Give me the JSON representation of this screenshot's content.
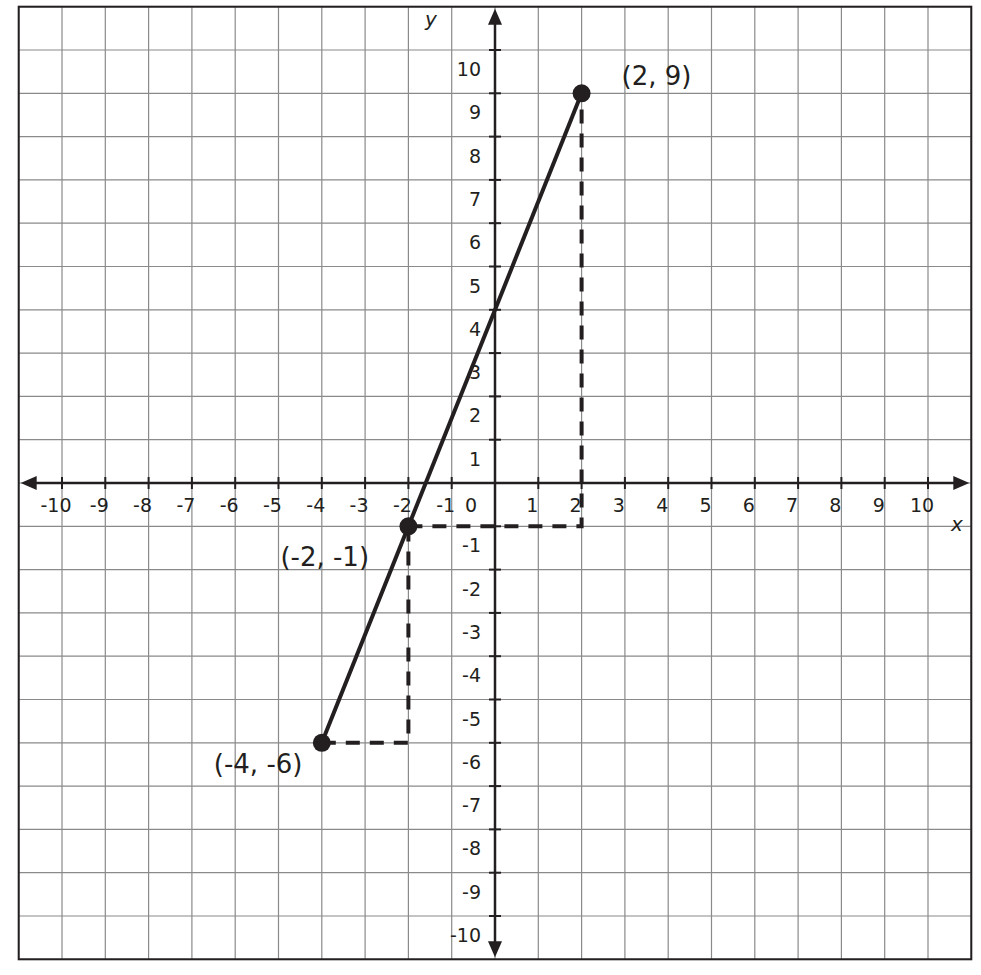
{
  "chart_data": {
    "type": "line",
    "title": "",
    "xlabel": "x",
    "ylabel": "y",
    "xlim": [
      -11,
      11
    ],
    "ylim": [
      -11,
      11
    ],
    "grid": true,
    "x_ticks": [
      -10,
      -9,
      -8,
      -7,
      -6,
      -5,
      -4,
      -3,
      -2,
      -1,
      0,
      1,
      2,
      3,
      4,
      5,
      6,
      7,
      8,
      9,
      10
    ],
    "y_ticks": [
      -10,
      -9,
      -8,
      -7,
      -6,
      -5,
      -4,
      -3,
      -2,
      -1,
      1,
      2,
      3,
      4,
      5,
      6,
      7,
      8,
      9,
      10
    ],
    "series": [
      {
        "name": "line",
        "style": "solid",
        "points": [
          {
            "x": -4,
            "y": -6
          },
          {
            "x": 2,
            "y": 9
          }
        ]
      }
    ],
    "points": [
      {
        "x": -4,
        "y": -6,
        "label": "(-4, -6)"
      },
      {
        "x": -2,
        "y": -1,
        "label": "(-2, -1)"
      },
      {
        "x": 2,
        "y": 9,
        "label": "(2, 9)"
      }
    ],
    "slope_triangles": [
      {
        "from": {
          "x": -4,
          "y": -6
        },
        "corner": {
          "x": -2,
          "y": -6
        },
        "to": {
          "x": -2,
          "y": -1
        },
        "style": "dashed"
      },
      {
        "from": {
          "x": -2,
          "y": -1
        },
        "corner": {
          "x": 2,
          "y": -1
        },
        "to": {
          "x": 2,
          "y": 9
        },
        "style": "dashed"
      }
    ],
    "colors": {
      "ink": "#231f20",
      "grid": "#8a8a8a",
      "background": "#ffffff"
    }
  }
}
